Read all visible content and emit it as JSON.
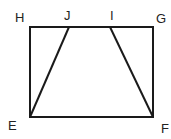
{
  "diagram": {
    "type": "geometry",
    "stroke_color": "#1a1a1a",
    "points": [
      {
        "label": "H",
        "x": 30,
        "y": 27
      },
      {
        "label": "J",
        "x": 69,
        "y": 27
      },
      {
        "label": "I",
        "x": 110,
        "y": 27
      },
      {
        "label": "G",
        "x": 153,
        "y": 27
      },
      {
        "label": "E",
        "x": 30,
        "y": 117
      },
      {
        "label": "F",
        "x": 153,
        "y": 117
      }
    ],
    "segments": [
      "HG",
      "GF",
      "FE",
      "EH",
      "EJ",
      "IF"
    ],
    "labels": {
      "H": "H",
      "J": "J",
      "I": "I",
      "G": "G",
      "E": "E",
      "F": "F"
    }
  }
}
